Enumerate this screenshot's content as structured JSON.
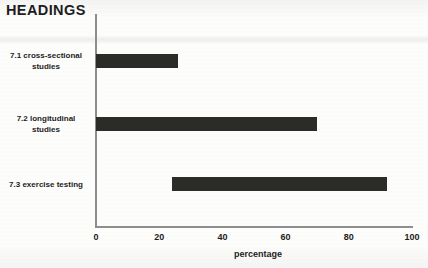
{
  "heading": "HEADINGS",
  "chart_data": {
    "type": "bar",
    "orientation": "horizontal",
    "title": "HEADINGS",
    "xlabel": "percentage",
    "ylabel": "",
    "xlim": [
      0,
      100
    ],
    "xticks": [
      0,
      20,
      40,
      60,
      80,
      100
    ],
    "xtick_labels": [
      "0",
      "20",
      "40",
      "60",
      "80",
      "100"
    ],
    "grid": false,
    "legend": null,
    "categories": [
      "7.1 cross-sectional studies",
      "7.2 longitudinal studies",
      "7.3 exercise testing"
    ],
    "bars": [
      {
        "label": "7.1 cross-sectional studies",
        "label_line1": "7.1 cross-sectional",
        "label_line2": "studies",
        "start": 0,
        "end": 26,
        "value": 26
      },
      {
        "label": "7.2 longitudinal studies",
        "label_line1": "7.2 longitudinal",
        "label_line2": "studies",
        "start": 0,
        "end": 70,
        "value": 70
      },
      {
        "label": "7.3 exercise testing",
        "label_line1": "7.3 exercise testing",
        "label_line2": "",
        "start": 24,
        "end": 92,
        "value": 68
      }
    ],
    "bar_color": "#2b2b28",
    "axis_color": "#8e8e8e",
    "background_color": "#fdfdfc"
  }
}
